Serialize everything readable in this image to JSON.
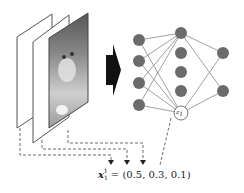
{
  "diagram": {
    "input_frames": [
      {
        "id": "frame-back",
        "label": ""
      },
      {
        "id": "frame-middle",
        "label": ""
      },
      {
        "id": "frame-front",
        "content": "cat-photo"
      }
    ],
    "arrow": {
      "direction": "right",
      "color": "#111111"
    },
    "network": {
      "layers": [
        {
          "name": "input",
          "nodes": 4
        },
        {
          "name": "hidden",
          "nodes": 5
        },
        {
          "name": "output",
          "nodes": 2
        }
      ],
      "node_color": "#6b6b6b",
      "edge_color": "#888888",
      "highlighted_node": {
        "label_base": "z",
        "label_sub": "1",
        "label_sup": "1"
      }
    },
    "formula": {
      "var": "x",
      "sub": "1",
      "sup": "1",
      "equals": "=",
      "values": "(0.5, 0.3, 0.1)"
    }
  }
}
